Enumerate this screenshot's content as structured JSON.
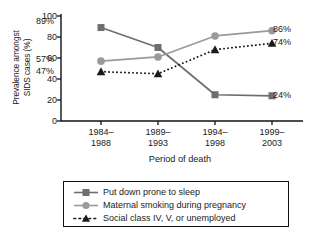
{
  "chart_data": {
    "type": "line",
    "title": "",
    "xlabel": "Period of death",
    "ylabel": "Prevalence amongst SIDS cases (%)",
    "ylabel_line1": "Prevalence amongst",
    "ylabel_line2": "SIDS cases (%)",
    "categories": [
      "1984–1988",
      "1989–1993",
      "1994–1998",
      "1999–2003"
    ],
    "category_lines": [
      [
        "1984–",
        "1988"
      ],
      [
        "1989–",
        "1993"
      ],
      [
        "1994–",
        "1998"
      ],
      [
        "1999–",
        "2003"
      ]
    ],
    "ylim": [
      0,
      100
    ],
    "yticks": [
      0,
      20,
      40,
      60,
      80,
      100
    ],
    "ytick_labels": [
      "0",
      "20",
      "40",
      "60",
      "80",
      "100"
    ],
    "grid": false,
    "legend_position": "below",
    "series": [
      {
        "name": "Put down prone to sleep",
        "values": [
          89,
          70,
          25,
          24
        ],
        "marker": "square",
        "line_style": "solid",
        "color": "#6e6e6e",
        "start_label": "89%",
        "end_label": "24%"
      },
      {
        "name": "Maternal smoking during pregnancy",
        "values": [
          57,
          61,
          81,
          86
        ],
        "marker": "circle",
        "line_style": "solid",
        "color": "#9a9a9a",
        "start_label": "57%",
        "end_label": "86%"
      },
      {
        "name": "Social class IV, V, or unemployed",
        "values": [
          47,
          45,
          68,
          74
        ],
        "marker": "triangle",
        "line_style": "dotted",
        "color": "#1a1a1a",
        "start_label": "47%",
        "end_label": "74%"
      }
    ],
    "annotations": {
      "left_labels": [
        "89%",
        "57%",
        "47%"
      ],
      "right_labels": [
        "86%",
        "74%",
        "24%"
      ]
    }
  },
  "legend": {
    "items": [
      {
        "label": "Put down prone to sleep"
      },
      {
        "label": "Maternal smoking during pregnancy"
      },
      {
        "label": "Social class IV, V, or unemployed"
      }
    ]
  }
}
